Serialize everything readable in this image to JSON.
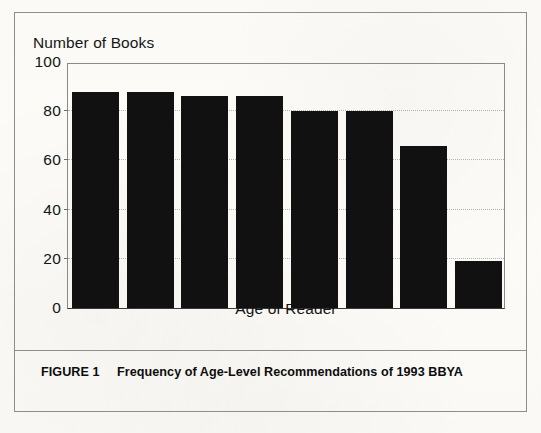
{
  "figure": {
    "caption_label": "FIGURE 1",
    "caption_text": "Frequency of Age-Level Recommendations of 1993 BBYA",
    "frame_color": "#8d8d8d",
    "background_color": "#fbfaf7"
  },
  "chart_data": {
    "type": "bar",
    "title": "",
    "subtitle": "",
    "xlabel": "Age of Reader",
    "ylabel": "Number of Books",
    "categories": [
      "12",
      "13",
      "14",
      "15",
      "16",
      "17",
      "18",
      "Adult"
    ],
    "values": [
      88,
      88,
      86,
      86,
      80,
      80,
      66,
      19
    ],
    "series": [
      {
        "name": "Number of Books",
        "values": [
          88,
          88,
          86,
          86,
          80,
          80,
          66,
          19
        ]
      }
    ],
    "ylim": [
      0,
      100
    ],
    "yticks": [
      0,
      20,
      40,
      60,
      80,
      100
    ],
    "ytick_labels": [
      "0",
      "20",
      "40",
      "60",
      "80",
      "100"
    ],
    "grid": "horizontal-dotted",
    "gridline_values": [
      20,
      40,
      60,
      80
    ],
    "legend": "none",
    "legend_position": "none",
    "bar_color": "#111111",
    "annotations": []
  }
}
